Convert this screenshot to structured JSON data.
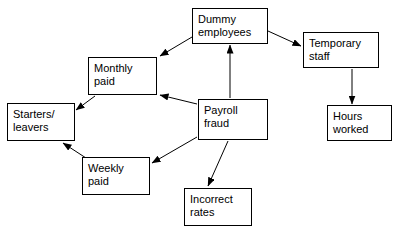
{
  "diagram": {
    "type": "node-link-diagram",
    "canvas": {
      "width": 403,
      "height": 232
    },
    "style": {
      "background_color": "#ffffff",
      "box_border_color": "#000000",
      "box_fill_color": "#ffffff",
      "arrow_color": "#000000",
      "text_color": "#000000"
    },
    "nodes": [
      {
        "id": "dummy-employees",
        "label": "Dummy\nemployees",
        "line1": "Dummy",
        "line2": "employees",
        "x": 192,
        "y": 8,
        "width": 76,
        "height": 36
      },
      {
        "id": "temporary-staff",
        "label": "Temporary\nstaff",
        "line1": "Temporary",
        "line2": "staff",
        "x": 303,
        "y": 32,
        "width": 76,
        "height": 36
      },
      {
        "id": "hours-worked",
        "label": "Hours\nworked",
        "line1": "Hours",
        "line2": "worked",
        "x": 327,
        "y": 105,
        "width": 65,
        "height": 36
      },
      {
        "id": "monthly-paid",
        "label": "Monthly\npaid",
        "line1": "Monthly",
        "line2": "paid",
        "x": 88,
        "y": 57,
        "width": 69,
        "height": 38
      },
      {
        "id": "payroll-fraud",
        "label": "Payroll\nfraud",
        "line1": "Payroll",
        "line2": "fraud",
        "x": 198,
        "y": 99,
        "width": 70,
        "height": 41
      },
      {
        "id": "starters-leavers",
        "label": "Starters/\nleavers",
        "line1": "Starters/",
        "line2": "leavers",
        "x": 7,
        "y": 103,
        "width": 68,
        "height": 38
      },
      {
        "id": "weekly-paid",
        "label": "Weekly\npaid",
        "line1": "Weekly",
        "line2": "paid",
        "x": 82,
        "y": 157,
        "width": 68,
        "height": 38
      },
      {
        "id": "incorrect-rates",
        "label": "Incorrect\nrates",
        "line1": "Incorrect",
        "line2": "rates",
        "x": 184,
        "y": 188,
        "width": 68,
        "height": 38
      }
    ],
    "edges": [
      {
        "id": "dummy-to-monthly",
        "from": "dummy-employees",
        "to": "monthly-paid",
        "arrowhead": "to"
      },
      {
        "id": "dummy-to-temporary",
        "from": "dummy-employees",
        "to": "temporary-staff",
        "arrowhead": "to"
      },
      {
        "id": "temporary-to-hours",
        "from": "temporary-staff",
        "to": "hours-worked",
        "arrowhead": "to"
      },
      {
        "id": "payroll-to-dummy",
        "from": "payroll-fraud",
        "to": "dummy-employees",
        "arrowhead": "to"
      },
      {
        "id": "payroll-to-monthly",
        "from": "payroll-fraud",
        "to": "monthly-paid",
        "arrowhead": "to"
      },
      {
        "id": "payroll-to-weekly",
        "from": "payroll-fraud",
        "to": "weekly-paid",
        "arrowhead": "to"
      },
      {
        "id": "payroll-to-incorrect",
        "from": "payroll-fraud",
        "to": "incorrect-rates",
        "arrowhead": "to"
      },
      {
        "id": "monthly-to-starters",
        "from": "monthly-paid",
        "to": "starters-leavers",
        "arrowhead": "to"
      },
      {
        "id": "weekly-to-starters",
        "from": "weekly-paid",
        "to": "starters-leavers",
        "arrowhead": "to"
      }
    ]
  }
}
